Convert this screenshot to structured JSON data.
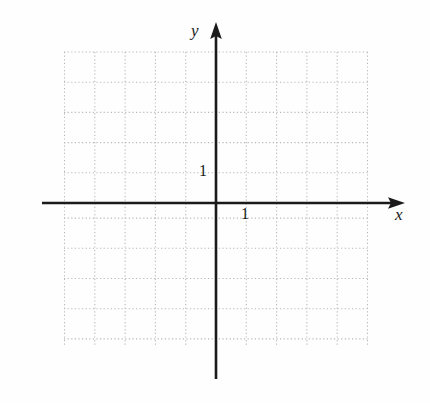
{
  "figure": {
    "kind": "cartesian-coordinate-grid",
    "background_color": "#fefefe",
    "axis_color": "#1a1a1a",
    "grid_color": "#b8b8b8"
  },
  "axes": {
    "x": {
      "label": "x",
      "arrow": "right-arrow-icon"
    },
    "y": {
      "label": "y",
      "arrow": "up-arrow-icon"
    }
  },
  "tick_labels": {
    "x_one": "1",
    "y_one": "1"
  },
  "chart_data": {
    "type": "scatter",
    "title": "",
    "subtitle": "",
    "xlabel": "x",
    "ylabel": "y",
    "xlim": [
      -5,
      5
    ],
    "ylim": [
      -4.5,
      5
    ],
    "xticks": [
      -5,
      -4,
      -3,
      -2,
      -1,
      0,
      1,
      2,
      3,
      4,
      5
    ],
    "yticks": [
      -4.5,
      -3.5,
      -2.5,
      -1.5,
      -0.5,
      0,
      1,
      2,
      3,
      4,
      5
    ],
    "x_tick_labels": [
      "1"
    ],
    "y_tick_labels": [
      "1"
    ],
    "grid": true,
    "grid_style": "dotted",
    "grid_spacing_units": 1,
    "legend": null,
    "series": [],
    "x": [],
    "values": [],
    "annotations": [],
    "note": "Empty blank graph paper: Cartesian plane with dotted unit grid, arrowed x and y axes, unit marks labeled 1 on each axis. No data plotted."
  },
  "geometry": {
    "origin_px": [
      216,
      203
    ],
    "unit_px_x": 30.3,
    "unit_px_y": 30.2,
    "grid_left_px": 64,
    "grid_right_px": 368,
    "grid_top_px": 52,
    "grid_bottom_px": 346,
    "x_axis_start_px": 42,
    "x_axis_end_px": 405,
    "y_axis_top_px": 22,
    "y_axis_bottom_px": 379
  }
}
